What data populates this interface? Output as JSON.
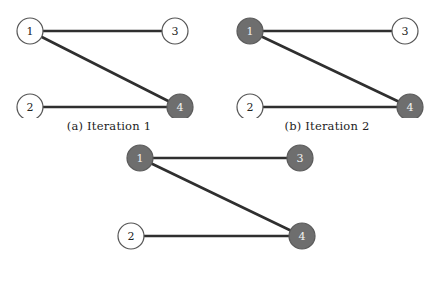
{
  "figure": {
    "colors": {
      "node_filled": "#6e6e6e",
      "node_open": "#ffffff",
      "node_stroke": "#555555",
      "edge": "#2f2f2f",
      "text": "#232323",
      "text_on_filled": "#f2f2f2",
      "background": "#ffffff"
    },
    "panels": [
      {
        "id": "a",
        "caption": "(a) Iteration 1",
        "nodes": [
          {
            "id": "1",
            "label": "1",
            "cx": 30,
            "cy": 31,
            "r": 13,
            "filled": false
          },
          {
            "id": "3",
            "label": "3",
            "cx": 175,
            "cy": 31,
            "r": 13,
            "filled": false
          },
          {
            "id": "2",
            "label": "2",
            "cx": 30,
            "cy": 107,
            "r": 13,
            "filled": false
          },
          {
            "id": "4",
            "label": "4",
            "cx": 180,
            "cy": 107,
            "r": 13,
            "filled": true
          }
        ],
        "edges": [
          {
            "from": "1",
            "to": "3"
          },
          {
            "from": "1",
            "to": "4"
          },
          {
            "from": "2",
            "to": "4"
          }
        ]
      },
      {
        "id": "b",
        "caption": "(b) Iteration 2",
        "nodes": [
          {
            "id": "1",
            "label": "1",
            "cx": 32,
            "cy": 31,
            "r": 13,
            "filled": true
          },
          {
            "id": "3",
            "label": "3",
            "cx": 187,
            "cy": 31,
            "r": 13,
            "filled": false
          },
          {
            "id": "2",
            "label": "2",
            "cx": 32,
            "cy": 107,
            "r": 13,
            "filled": false
          },
          {
            "id": "4",
            "label": "4",
            "cx": 192,
            "cy": 107,
            "r": 13,
            "filled": true
          }
        ],
        "edges": [
          {
            "from": "1",
            "to": "3"
          },
          {
            "from": "1",
            "to": "4"
          },
          {
            "from": "2",
            "to": "4"
          }
        ]
      },
      {
        "id": "c",
        "caption": "(c) Iteration 3",
        "nodes": [
          {
            "id": "1",
            "label": "1",
            "cx": 40,
            "cy": 18,
            "r": 13,
            "filled": true
          },
          {
            "id": "3",
            "label": "3",
            "cx": 200,
            "cy": 18,
            "r": 13,
            "filled": true
          },
          {
            "id": "2",
            "label": "2",
            "cx": 31,
            "cy": 96,
            "r": 13,
            "filled": false
          },
          {
            "id": "4",
            "label": "4",
            "cx": 202,
            "cy": 96,
            "r": 13,
            "filled": true
          }
        ],
        "edges": [
          {
            "from": "1",
            "to": "3"
          },
          {
            "from": "1",
            "to": "4"
          },
          {
            "from": "2",
            "to": "4"
          }
        ]
      }
    ]
  }
}
